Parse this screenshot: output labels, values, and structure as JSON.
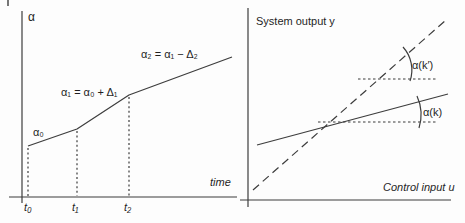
{
  "figure": {
    "left_plot": {
      "y_axis_label": "α",
      "x_axis_label": "time",
      "start_label": "α₀",
      "segment1_label": "α₁ = α₀ + Δ₁",
      "segment2_label": "α₂ = α₁ − Δ₂",
      "x_ticks": [
        "t₀",
        "t₁",
        "t₂"
      ]
    },
    "right_plot": {
      "y_axis_label": "System output y",
      "x_axis_label": "Control input u",
      "angle_label_dashed": "α(k′)",
      "angle_label_solid": "α(k)"
    },
    "colors": {
      "line": "#3d3d3d",
      "text": "#1f1f1f",
      "background": "#fdfdfd"
    }
  }
}
